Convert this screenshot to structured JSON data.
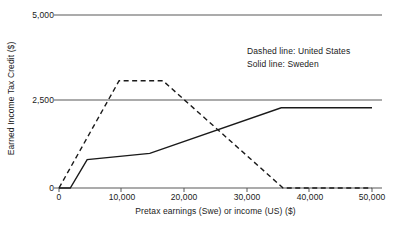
{
  "chart_data": {
    "type": "line",
    "title": "",
    "xlabel": "Pretax earnings (Swe) or income (US) ($)",
    "ylabel": "Earned Income Tax Credit ($)",
    "xlim": [
      0,
      50000
    ],
    "ylim": [
      0,
      5000
    ],
    "grid": "horizontal reference lines at 0, 2,500 and 5,000",
    "legend_position": "upper right inside plot",
    "xticks": [
      0,
      10000,
      20000,
      30000,
      40000,
      50000
    ],
    "xtick_labels": [
      "0",
      "10,000",
      "20,000",
      "30,000",
      "40,000",
      "50,000"
    ],
    "yticks": [
      0,
      2500,
      5000
    ],
    "ytick_labels": [
      "0",
      "2,500",
      "5,000"
    ],
    "series": [
      {
        "name": "United States",
        "style": "dashed",
        "color": "#1a1a1a",
        "legend_text": "Dashed line: United States",
        "x": [
          0,
          9600,
          16600,
          35800,
          50000
        ],
        "values": [
          0,
          3100,
          3100,
          0,
          0
        ]
      },
      {
        "name": "Sweden",
        "style": "solid",
        "color": "#1a1a1a",
        "legend_text": "Solid line: Sweden",
        "x": [
          0,
          1800,
          4500,
          14500,
          35500,
          50000
        ],
        "values": [
          0,
          0,
          820,
          1000,
          2320,
          2320
        ]
      }
    ]
  },
  "axes": {
    "y_ticks": [
      {
        "label": "5,000"
      },
      {
        "label": "2,500"
      },
      {
        "label": "0"
      }
    ],
    "x_ticks": [
      {
        "label": "0"
      },
      {
        "label": "10,000"
      },
      {
        "label": "20,000"
      },
      {
        "label": "30,000"
      },
      {
        "label": "40,000"
      },
      {
        "label": "50,000"
      }
    ],
    "x_title": "Pretax earnings (Swe) or income (US) ($)",
    "y_title": "Earned Income Tax Credit ($)"
  },
  "legend": {
    "line1": "Dashed line: United States",
    "line2": "Solid line: Sweden"
  },
  "colors": {
    "line": "#1a1a1a",
    "gridline": "#595959",
    "axis": "#595959",
    "background": "#ffffff"
  }
}
